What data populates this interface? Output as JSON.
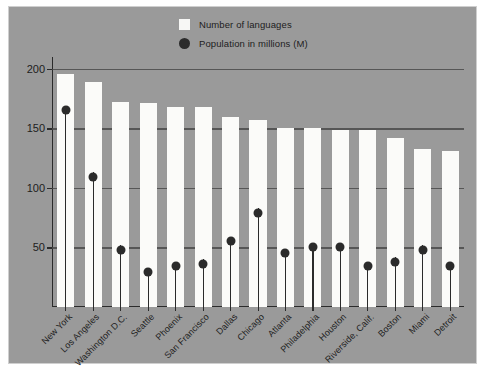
{
  "chart_data": {
    "type": "bar",
    "title": "",
    "subtitle": "",
    "xlabel": "",
    "ylabel": "",
    "ylim": [
      0,
      210
    ],
    "yticks": [
      50,
      100,
      150,
      200
    ],
    "grid": "horizontal",
    "legend_position": "top-center",
    "categories": [
      "New York",
      "Los Angeles",
      "Washington D.C.",
      "Seattle",
      "Phoenix",
      "San Francisco",
      "Dallas",
      "Chicago",
      "Atlanta",
      "Philadelphia",
      "Houston",
      "Riverside, Calif.",
      "Boston",
      "Miami",
      "Detroit"
    ],
    "series": [
      {
        "name": "Number of languages",
        "type": "bar",
        "color": "#fbfbf9",
        "values": [
          196,
          189,
          172,
          171,
          168,
          168,
          160,
          157,
          150,
          150,
          149,
          149,
          142,
          133,
          131
        ]
      },
      {
        "name": "Population in millions (M)",
        "type": "scatter",
        "color": "#2b2b2b",
        "values": [
          169,
          113,
          52,
          33,
          38,
          40,
          59,
          83,
          49,
          54,
          54,
          38,
          42,
          52,
          38
        ]
      }
    ]
  },
  "legend": {
    "items": [
      {
        "label": "Number of languages",
        "marker": "square-swatch",
        "color": "#fbfbf9"
      },
      {
        "label": "Population in millions (M)",
        "marker": "circle-dot",
        "color": "#2b2b2b"
      }
    ]
  },
  "colors": {
    "plot_background": "#9a9a9a",
    "bar_fill": "#fbfbf9",
    "dot_fill": "#2b2b2b",
    "axis": "#2b2b2b",
    "gridline": "#4a4a4a",
    "text": "#1d1d1d",
    "page_background": "#ffffff"
  }
}
